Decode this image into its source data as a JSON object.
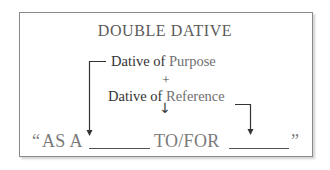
{
  "diagram": {
    "title": "DOUBLE DATIVE",
    "purpose": {
      "prefix": "Dative of ",
      "accent": "Purpose"
    },
    "plus": "+",
    "reference": {
      "prefix": "Dative of ",
      "accent": "Reference"
    },
    "down_arrow": "↓",
    "formula": {
      "open_quote": "“",
      "part1": "AS A",
      "part2": "TO/FOR",
      "close_quote": "”"
    },
    "colors": {
      "text_dark": "#333333",
      "text_grey": "#7a7a7a",
      "border": "#8a8a8a"
    }
  }
}
